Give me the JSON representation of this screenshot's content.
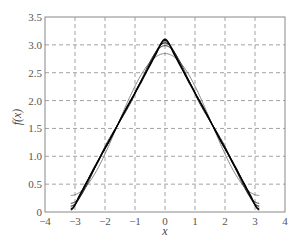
{
  "chart_data": {
    "type": "line",
    "title": "",
    "xlabel": "x",
    "ylabel": "f(x)",
    "xlim": [
      -4,
      4
    ],
    "ylim": [
      0,
      3.5
    ],
    "xticks": [
      -4,
      -3,
      -2,
      -1,
      0,
      1,
      2,
      3,
      4
    ],
    "xtick_labels": [
      "−4",
      "−3",
      "−2",
      "−1",
      "0",
      "1",
      "2",
      "3",
      "4"
    ],
    "yticks": [
      0,
      0.5,
      1.0,
      1.5,
      2.0,
      2.5,
      3.0,
      3.5
    ],
    "ytick_labels": [
      "0",
      "0.5",
      "1.0",
      "1.5",
      "2.0",
      "2.5",
      "3.0",
      "3.5"
    ],
    "grid": true,
    "grid_style": "dashed",
    "legend": null,
    "domain": [
      -3.14159,
      3.14159
    ],
    "series": [
      {
        "name": "N=1",
        "terms": 1,
        "color": "#777777",
        "width": 0.9,
        "x": [
          -3.14,
          -2,
          -1,
          0,
          1,
          2,
          3.14
        ],
        "values": [
          0.3,
          1.04,
          2.26,
          2.84,
          2.26,
          1.04,
          0.3
        ]
      },
      {
        "name": "N=2",
        "terms": 2,
        "color": "#333333",
        "width": 1.0,
        "x": [
          -3.14,
          -2,
          -1,
          0,
          1,
          2,
          3.14
        ],
        "values": [
          0.16,
          1.17,
          2.13,
          2.98,
          2.13,
          1.17,
          0.16
        ]
      },
      {
        "name": "N=3",
        "terms": 3,
        "color": "#222222",
        "width": 1.1,
        "x": [
          -3.14,
          -2,
          -1,
          0,
          1,
          2,
          3.14
        ],
        "values": [
          0.11,
          1.12,
          2.16,
          3.03,
          2.16,
          1.12,
          0.11
        ]
      },
      {
        "name": "N=5",
        "terms": 5,
        "color": "#111111",
        "width": 1.2,
        "x": [
          -3.14,
          -2,
          -1,
          0,
          1,
          2,
          3.14
        ],
        "values": [
          0.07,
          1.13,
          2.14,
          3.07,
          2.14,
          1.13,
          0.07
        ]
      },
      {
        "name": "N=8",
        "terms": 8,
        "color": "#000000",
        "width": 1.3,
        "x": [
          -3.14,
          -2,
          -1,
          0,
          1,
          2,
          3.14
        ],
        "values": [
          0.04,
          1.14,
          2.14,
          3.1,
          2.14,
          1.14,
          0.04
        ]
      }
    ]
  }
}
